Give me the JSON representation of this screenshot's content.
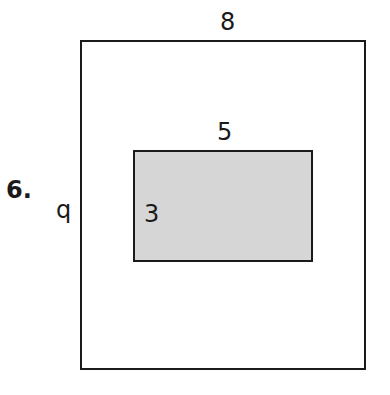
{
  "problem": {
    "number": "6.",
    "outer_rectangle": {
      "width_label": "8",
      "height_label": "q",
      "fill": "#ffffff"
    },
    "inner_rectangle": {
      "width_label": "5",
      "height_label": "3",
      "fill": "#d6d6d6"
    }
  }
}
